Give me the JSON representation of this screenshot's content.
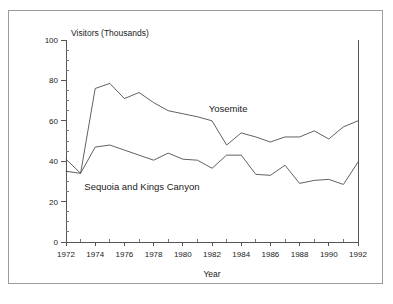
{
  "chart_data": {
    "type": "line",
    "title": "",
    "ylabel": "Visitors (Thousands)",
    "xlabel": "Year",
    "xlim": [
      1972,
      1992
    ],
    "ylim": [
      0,
      100
    ],
    "grid": false,
    "legend_position": "inline-annotations",
    "y_ticks": [
      0,
      20,
      40,
      60,
      80,
      100
    ],
    "y_tick_labels": [
      "0",
      "20",
      "40",
      "60",
      "80",
      "100"
    ],
    "y_minor_tick_step": 5,
    "x_ticks": [
      1972,
      1974,
      1976,
      1978,
      1980,
      1982,
      1984,
      1986,
      1988,
      1990,
      1992
    ],
    "x_tick_labels": [
      "1972",
      "1974",
      "1976",
      "1978",
      "1980",
      "1982",
      "1984",
      "1986",
      "1988",
      "1990",
      "1992"
    ],
    "x_minor_tick_step": 1,
    "x": [
      1972,
      1973,
      1974,
      1975,
      1976,
      1977,
      1978,
      1979,
      1980,
      1981,
      1982,
      1983,
      1984,
      1985,
      1986,
      1987,
      1988,
      1989,
      1990,
      1991,
      1992
    ],
    "series": [
      {
        "name": "Yosemite",
        "label_x": 1983.1,
        "label_y": 64.5,
        "values": [
          41.0,
          34.0,
          76.0,
          78.5,
          71.0,
          74.0,
          69.0,
          65.0,
          63.5,
          62.0,
          60.0,
          48.0,
          54.0,
          52.0,
          49.5,
          52.0,
          52.0,
          55.0,
          51.0,
          57.0,
          60.0
        ]
      },
      {
        "name": "Sequoia and Kings Canyon",
        "label_x": 1977.2,
        "label_y": 25.5,
        "values": [
          35.0,
          34.0,
          47.0,
          48.0,
          45.5,
          43.0,
          40.5,
          44.0,
          41.0,
          40.5,
          36.5,
          43.0,
          43.0,
          33.5,
          33.0,
          38.0,
          29.0,
          30.5,
          31.0,
          28.5,
          39.5
        ]
      }
    ]
  },
  "axis_titles": {
    "y": "Visitors (Thousands)",
    "x": "Year"
  }
}
